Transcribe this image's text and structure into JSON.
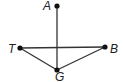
{
  "diagram": {
    "type": "geometry",
    "colors": {
      "line": "#333333",
      "point": "#111111",
      "label": "#222222",
      "background": "#ffffff"
    },
    "points": {
      "A": {
        "label": "A",
        "x": 57,
        "y": 6,
        "lx": 43,
        "ly": 10
      },
      "T": {
        "label": "T",
        "x": 20,
        "y": 48,
        "lx": 8,
        "ly": 53
      },
      "B": {
        "label": "B",
        "x": 105,
        "y": 47,
        "lx": 110,
        "ly": 53
      },
      "G": {
        "label": "G",
        "x": 57,
        "y": 70,
        "lx": 55,
        "ly": 81
      }
    },
    "segments": [
      {
        "name": "segment-AG",
        "from": "A",
        "to": "G"
      },
      {
        "name": "segment-TB",
        "from": "T",
        "to": "B"
      },
      {
        "name": "segment-TG",
        "from": "T",
        "to": "G"
      },
      {
        "name": "segment-GB",
        "from": "G",
        "to": "B"
      }
    ]
  }
}
